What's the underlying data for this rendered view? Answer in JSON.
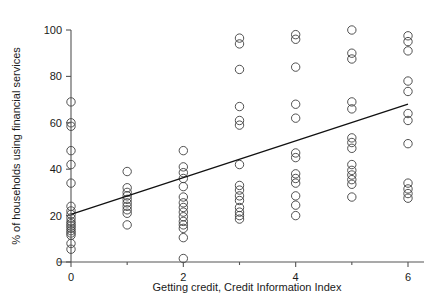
{
  "chart_data": {
    "type": "scatter",
    "title": "",
    "xlabel": "Getting credit, Credit Information Index",
    "ylabel": "% of households using financial services",
    "xlim": [
      -0.35,
      6.45
    ],
    "ylim": [
      0,
      104
    ],
    "xticks": [
      0,
      2,
      4,
      6
    ],
    "xtick_labels": [
      "0",
      "2",
      "4",
      "6"
    ],
    "xminorticks": [
      1,
      3,
      5
    ],
    "yticks": [
      0,
      20,
      40,
      60,
      80,
      100
    ],
    "ytick_labels": [
      "0",
      "20",
      "40",
      "60",
      "80",
      "100"
    ],
    "grid": false,
    "legend": null,
    "marker": "open-circle",
    "marker_radius_px": 4.2,
    "points": [
      {
        "x": 0,
        "y": 69.0
      },
      {
        "x": 0,
        "y": 60.0
      },
      {
        "x": 0,
        "y": 58.5
      },
      {
        "x": 0,
        "y": 48.0
      },
      {
        "x": 0,
        "y": 42.0
      },
      {
        "x": 0,
        "y": 34.0
      },
      {
        "x": 0,
        "y": 24.0
      },
      {
        "x": 0,
        "y": 22.0
      },
      {
        "x": 0,
        "y": 20.5
      },
      {
        "x": 0,
        "y": 19.0
      },
      {
        "x": 0,
        "y": 17.5
      },
      {
        "x": 0,
        "y": 16.5
      },
      {
        "x": 0,
        "y": 15.5
      },
      {
        "x": 0,
        "y": 14.5
      },
      {
        "x": 0,
        "y": 13.5
      },
      {
        "x": 0,
        "y": 12.5
      },
      {
        "x": 0,
        "y": 11.5
      },
      {
        "x": 0,
        "y": 8.0
      },
      {
        "x": 0,
        "y": 5.5
      },
      {
        "x": 1,
        "y": 39.0
      },
      {
        "x": 1,
        "y": 32.0
      },
      {
        "x": 1,
        "y": 30.0
      },
      {
        "x": 1,
        "y": 28.5
      },
      {
        "x": 1,
        "y": 27.0
      },
      {
        "x": 1,
        "y": 25.5
      },
      {
        "x": 1,
        "y": 24.0
      },
      {
        "x": 1,
        "y": 22.5
      },
      {
        "x": 1,
        "y": 21.0
      },
      {
        "x": 1,
        "y": 16.0
      },
      {
        "x": 2,
        "y": 48.0
      },
      {
        "x": 2,
        "y": 41.0
      },
      {
        "x": 2,
        "y": 38.5
      },
      {
        "x": 2,
        "y": 36.0
      },
      {
        "x": 2,
        "y": 32.5
      },
      {
        "x": 2,
        "y": 28.0
      },
      {
        "x": 2,
        "y": 25.5
      },
      {
        "x": 2,
        "y": 23.5
      },
      {
        "x": 2,
        "y": 21.5
      },
      {
        "x": 2,
        "y": 19.5
      },
      {
        "x": 2,
        "y": 17.5
      },
      {
        "x": 2,
        "y": 16.0
      },
      {
        "x": 2,
        "y": 14.5
      },
      {
        "x": 2,
        "y": 10.5
      },
      {
        "x": 2,
        "y": 1.5
      },
      {
        "x": 3,
        "y": 96.5
      },
      {
        "x": 3,
        "y": 94.0
      },
      {
        "x": 3,
        "y": 83.0
      },
      {
        "x": 3,
        "y": 67.0
      },
      {
        "x": 3,
        "y": 61.0
      },
      {
        "x": 3,
        "y": 59.0
      },
      {
        "x": 3,
        "y": 42.0
      },
      {
        "x": 3,
        "y": 33.0
      },
      {
        "x": 3,
        "y": 31.0
      },
      {
        "x": 3,
        "y": 28.5
      },
      {
        "x": 3,
        "y": 26.5
      },
      {
        "x": 3,
        "y": 23.5
      },
      {
        "x": 3,
        "y": 21.5
      },
      {
        "x": 3,
        "y": 20.0
      },
      {
        "x": 3,
        "y": 18.5
      },
      {
        "x": 4,
        "y": 98.0
      },
      {
        "x": 4,
        "y": 96.0
      },
      {
        "x": 4,
        "y": 84.0
      },
      {
        "x": 4,
        "y": 68.0
      },
      {
        "x": 4,
        "y": 62.0
      },
      {
        "x": 4,
        "y": 47.0
      },
      {
        "x": 4,
        "y": 45.0
      },
      {
        "x": 4,
        "y": 38.0
      },
      {
        "x": 4,
        "y": 36.0
      },
      {
        "x": 4,
        "y": 34.0
      },
      {
        "x": 4,
        "y": 28.5
      },
      {
        "x": 4,
        "y": 24.5
      },
      {
        "x": 4,
        "y": 20.0
      },
      {
        "x": 5,
        "y": 100.0
      },
      {
        "x": 5,
        "y": 90.0
      },
      {
        "x": 5,
        "y": 87.5
      },
      {
        "x": 5,
        "y": 69.0
      },
      {
        "x": 5,
        "y": 66.0
      },
      {
        "x": 5,
        "y": 53.5
      },
      {
        "x": 5,
        "y": 51.5
      },
      {
        "x": 5,
        "y": 49.0
      },
      {
        "x": 5,
        "y": 42.0
      },
      {
        "x": 5,
        "y": 39.5
      },
      {
        "x": 5,
        "y": 37.5
      },
      {
        "x": 5,
        "y": 35.5
      },
      {
        "x": 5,
        "y": 33.5
      },
      {
        "x": 5,
        "y": 28.0
      },
      {
        "x": 6,
        "y": 97.5
      },
      {
        "x": 6,
        "y": 95.0
      },
      {
        "x": 6,
        "y": 91.0
      },
      {
        "x": 6,
        "y": 78.0
      },
      {
        "x": 6,
        "y": 73.5
      },
      {
        "x": 6,
        "y": 64.0
      },
      {
        "x": 6,
        "y": 61.0
      },
      {
        "x": 6,
        "y": 51.0
      },
      {
        "x": 6,
        "y": 34.0
      },
      {
        "x": 6,
        "y": 31.5
      },
      {
        "x": 6,
        "y": 29.5
      },
      {
        "x": 6,
        "y": 27.5
      }
    ],
    "fit_line": {
      "x0": 0,
      "y0": 20.5,
      "x1": 6,
      "y1": 68.0
    }
  },
  "colors": {
    "marker_stroke": "#3d3d3d",
    "axis": "#555555",
    "fit_line": "#111111",
    "text": "#1a1a1a",
    "background": "#ffffff"
  }
}
